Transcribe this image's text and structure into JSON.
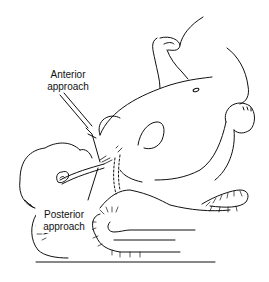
{
  "figure": {
    "labels": {
      "anterior": [
        "Anterior",
        "approach"
      ],
      "posterior": [
        "Posterior",
        "approach"
      ]
    },
    "colors": {
      "ink": "#111111",
      "background": "#ffffff"
    }
  }
}
